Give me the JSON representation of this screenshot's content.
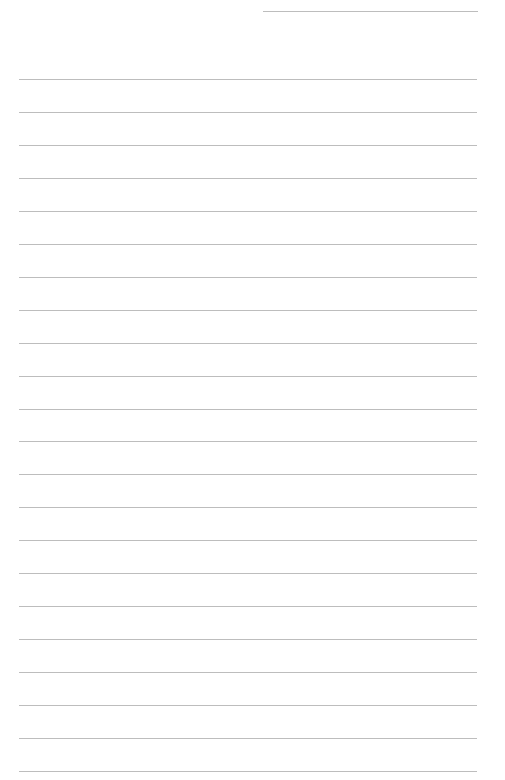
{
  "page": {
    "type": "ruled-notebook-page",
    "background_color": "#ffffff",
    "rule_color": "#bdbdbd",
    "header_rule": {
      "left": 263,
      "top": 11,
      "width": 215
    },
    "rules": {
      "count": 22,
      "first_top": 79,
      "spacing": 32.95,
      "left": 19,
      "width": 458
    },
    "text_lines": []
  }
}
